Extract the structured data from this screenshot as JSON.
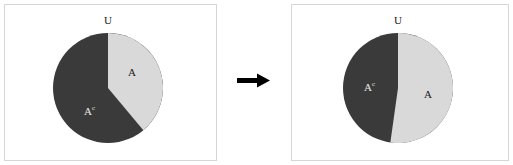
{
  "figure": {
    "title": "",
    "panels": [
      {
        "id": "before",
        "pie": {
          "labels": {
            "universe": "U",
            "event": "A",
            "complement": "A",
            "complement_superscript": "c"
          },
          "slices": [
            {
              "name": "A",
              "start_deg": 0,
              "end_deg": 140,
              "fraction": 0.389,
              "color": "#d9d9d9"
            },
            {
              "name": "Ac",
              "start_deg": 140,
              "end_deg": 360,
              "fraction": 0.611,
              "color": "#3a3a3a"
            }
          ]
        }
      },
      {
        "id": "after",
        "pie": {
          "labels": {
            "universe": "U",
            "event": "A",
            "complement": "A",
            "complement_superscript": "c"
          },
          "slices": [
            {
              "name": "A",
              "start_deg": 0,
              "end_deg": 188,
              "fraction": 0.522,
              "color": "#d9d9d9"
            },
            {
              "name": "Ac",
              "start_deg": 188,
              "end_deg": 360,
              "fraction": 0.478,
              "color": "#3a3a3a"
            }
          ]
        }
      }
    ],
    "transition": {
      "icon": "right-arrow-icon",
      "symbol": "→"
    },
    "colors": {
      "light_slice": "#d9d9d9",
      "dark_slice": "#3a3a3a",
      "panel_border": "#d6d6d6",
      "arrow": "#000000",
      "background": "#ffffff"
    }
  },
  "chart_data": {
    "type": "pie",
    "title": "",
    "xlabel": "",
    "ylabel": "",
    "legend": "none",
    "charts": [
      {
        "name": "before",
        "labels": [
          "A",
          "A^c"
        ],
        "values": [
          0.389,
          0.611
        ],
        "values_deg": [
          140,
          220
        ],
        "colors": [
          "#d9d9d9",
          "#3a3a3a"
        ],
        "start_angle_deg": 0,
        "direction": "clockwise",
        "annotations": [
          "U"
        ]
      },
      {
        "name": "after",
        "labels": [
          "A",
          "A^c"
        ],
        "values": [
          0.522,
          0.478
        ],
        "values_deg": [
          188,
          172
        ],
        "colors": [
          "#d9d9d9",
          "#3a3a3a"
        ],
        "start_angle_deg": 0,
        "direction": "clockwise",
        "annotations": [
          "U"
        ]
      }
    ]
  }
}
